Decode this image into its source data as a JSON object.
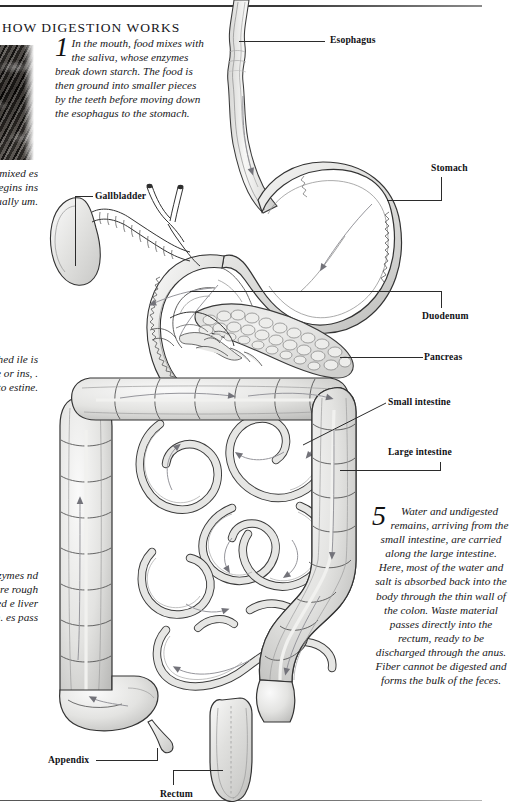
{
  "page": {
    "title": "HOW DIGESTION WORKS",
    "background_color": "#ffffff",
    "ink_color": "#1a1a1a",
    "organ_fill": "#e8e8e6",
    "organ_stroke": "#3a3a3a",
    "arrow_color": "#6f6f72"
  },
  "photo": {
    "name": "tissue-photograph-fragment",
    "description": "dark grayscale micrograph fragment bleeding off the left edge"
  },
  "paragraphs": [
    {
      "number": "1",
      "id": "mouth",
      "text": "In the mouth, food mixes with the saliva, whose enzymes break down starch. The food is then ground into smaller pieces by the teeth before moving down the esophagus to the stomach."
    },
    {
      "number": "2",
      "id": "stomach",
      "clipped": true,
      "text": "n omach. mixed es that n the egins ins and uick dually um."
    },
    {
      "number": "3",
      "id": "duodenum",
      "clipped": true,
      "text": "l enters bathed ile is nd r. fats. se or ins, . The y into estine."
    },
    {
      "number": "4",
      "id": "small-intestine",
      "clipped": true,
      "text": "igestion nall zymes nd uce the se are rough estine. ried e liver ion. es pass"
    },
    {
      "number": "5",
      "id": "large-intestine",
      "text": "Water and undigested remains, arriving from the small intestine, are carried along the large intestine. Here, most of the water and salt is absorbed back into the body through the thin wall of the colon. Waste material passes directly into the rectum, ready to be discharged through the anus. Fiber cannot be digested and forms the bulk of the feces."
    }
  ],
  "labels": [
    {
      "id": "esophagus",
      "text": "Esophagus"
    },
    {
      "id": "stomach",
      "text": "Stomach"
    },
    {
      "id": "gallbladder",
      "text": "Gallbladder"
    },
    {
      "id": "duodenum",
      "text": "Duodenum"
    },
    {
      "id": "pancreas",
      "text": "Pancreas"
    },
    {
      "id": "small-intestine",
      "text": "Small intestine"
    },
    {
      "id": "large-intestine",
      "text": "Large intestine"
    },
    {
      "id": "appendix",
      "text": "Appendix"
    },
    {
      "id": "rectum",
      "text": "Rectum"
    }
  ]
}
